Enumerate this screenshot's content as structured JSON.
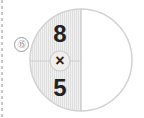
{
  "problem": {
    "number_label": "⑮",
    "top_value": "8",
    "operator": "×",
    "bottom_value": "5"
  },
  "colors": {
    "shaded_fill": "#ececec",
    "stroke": "#cfcfcf",
    "text": "#222222"
  }
}
